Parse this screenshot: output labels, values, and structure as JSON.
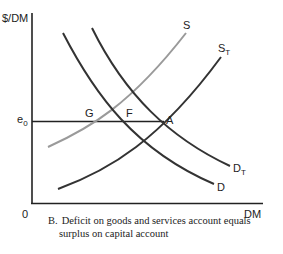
{
  "axes": {
    "y_label": "$/DM",
    "x_label": "DM",
    "origin_label": "0",
    "price_level_label": "e",
    "price_level_subscript": "0"
  },
  "curves": {
    "S": {
      "label": "S",
      "color": "#9a9a9a"
    },
    "ST": {
      "label": "S",
      "subscript": "T",
      "color": "#333333"
    },
    "D": {
      "label": "D",
      "color": "#333333"
    },
    "DT": {
      "label": "D",
      "subscript": "T",
      "color": "#333333"
    }
  },
  "points": {
    "G": "G",
    "F": "F",
    "A": "A"
  },
  "caption": {
    "letter": "B.",
    "line1": "Deficit on goods and services account equals",
    "line2": "surplus on capital account"
  }
}
